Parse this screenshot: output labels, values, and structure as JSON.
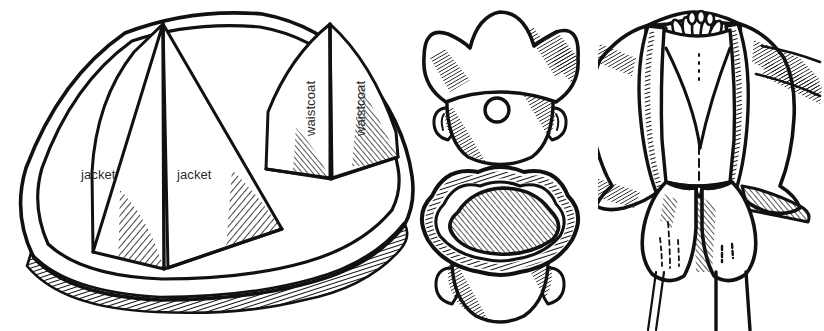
{
  "figure": {
    "style": "black ink line art with hatched shading on white background",
    "background_color": "#ffffff",
    "ink_color": "#111111",
    "label_color": "#2b2b2b",
    "width": 824,
    "height": 331
  },
  "labels": [
    {
      "id": "jacket-left",
      "text": "jacket",
      "x": 81,
      "y": 176,
      "rotation": 0
    },
    {
      "id": "jacket-right",
      "text": "jacket",
      "x": 177,
      "y": 176,
      "rotation": 0
    },
    {
      "id": "waistcoat-left",
      "text": "waistcoat",
      "x": 303,
      "y": 136,
      "rotation": -90
    },
    {
      "id": "waistcoat-right",
      "text": "waistcoat",
      "x": 353,
      "y": 136,
      "rotation": -90
    }
  ],
  "panels": [
    {
      "id": "brim-pattern",
      "name": "flattened hat brim pattern",
      "description": "large rounded outline containing four triangular gore panels",
      "gores": [
        {
          "label": "jacket",
          "position": "left"
        },
        {
          "label": "jacket",
          "position": "center-left"
        },
        {
          "label": "waistcoat",
          "position": "center-right"
        },
        {
          "label": "waistcoat",
          "position": "right"
        }
      ]
    },
    {
      "id": "hat-front-view",
      "name": "tricorn hat worn, front view",
      "features": [
        "three-peaked brim",
        "head",
        "two ears",
        "round cockade button"
      ]
    },
    {
      "id": "hat-top-view",
      "name": "tricorn hat, top-down view",
      "features": [
        "hatched crown",
        "corded brim edge",
        "head below",
        "two ears"
      ]
    },
    {
      "id": "costume-figure",
      "name": "costume torso: coat, waistcoat and breeches",
      "features": [
        "open frock coat with wide lapels",
        "looped cravat / neck ruffle",
        "buttoned waistcoat with centre dashed line",
        "knee breeches with dashed stitch detail",
        "turned-back cuffs with hatching"
      ]
    }
  ]
}
